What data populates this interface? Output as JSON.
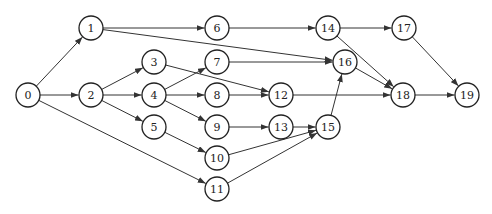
{
  "diagram": {
    "type": "directed-network",
    "node_radius": 12,
    "colors": {
      "stroke": "#222222",
      "fill": "#ffffff",
      "edge": "#333333"
    },
    "nodes": [
      {
        "id": "0",
        "label": "0",
        "x": 28,
        "y": 95
      },
      {
        "id": "1",
        "label": "1",
        "x": 91,
        "y": 28
      },
      {
        "id": "2",
        "label": "2",
        "x": 91,
        "y": 95
      },
      {
        "id": "3",
        "label": "3",
        "x": 154,
        "y": 62
      },
      {
        "id": "4",
        "label": "4",
        "x": 154,
        "y": 95
      },
      {
        "id": "5",
        "label": "5",
        "x": 154,
        "y": 127
      },
      {
        "id": "6",
        "label": "6",
        "x": 217,
        "y": 28
      },
      {
        "id": "7",
        "label": "7",
        "x": 217,
        "y": 62
      },
      {
        "id": "8",
        "label": "8",
        "x": 217,
        "y": 95
      },
      {
        "id": "9",
        "label": "9",
        "x": 217,
        "y": 127
      },
      {
        "id": "10",
        "label": "10",
        "x": 217,
        "y": 158
      },
      {
        "id": "11",
        "label": "11",
        "x": 217,
        "y": 189
      },
      {
        "id": "12",
        "label": "12",
        "x": 281,
        "y": 95
      },
      {
        "id": "13",
        "label": "13",
        "x": 281,
        "y": 127
      },
      {
        "id": "14",
        "label": "14",
        "x": 328,
        "y": 28
      },
      {
        "id": "15",
        "label": "15",
        "x": 328,
        "y": 127
      },
      {
        "id": "16",
        "label": "16",
        "x": 345,
        "y": 62
      },
      {
        "id": "17",
        "label": "17",
        "x": 404,
        "y": 28
      },
      {
        "id": "18",
        "label": "18",
        "x": 403,
        "y": 95
      },
      {
        "id": "19",
        "label": "19",
        "x": 467,
        "y": 95
      }
    ],
    "edges": [
      {
        "from": "0",
        "to": "1"
      },
      {
        "from": "0",
        "to": "2"
      },
      {
        "from": "0",
        "to": "11"
      },
      {
        "from": "1",
        "to": "6"
      },
      {
        "from": "1",
        "to": "16"
      },
      {
        "from": "2",
        "to": "3"
      },
      {
        "from": "2",
        "to": "4"
      },
      {
        "from": "2",
        "to": "5"
      },
      {
        "from": "3",
        "to": "12"
      },
      {
        "from": "4",
        "to": "7"
      },
      {
        "from": "4",
        "to": "8"
      },
      {
        "from": "4",
        "to": "9"
      },
      {
        "from": "5",
        "to": "10"
      },
      {
        "from": "6",
        "to": "14"
      },
      {
        "from": "7",
        "to": "16"
      },
      {
        "from": "8",
        "to": "12"
      },
      {
        "from": "9",
        "to": "13"
      },
      {
        "from": "10",
        "to": "15"
      },
      {
        "from": "11",
        "to": "15"
      },
      {
        "from": "13",
        "to": "15"
      },
      {
        "from": "12",
        "to": "18"
      },
      {
        "from": "14",
        "to": "17"
      },
      {
        "from": "14",
        "to": "18"
      },
      {
        "from": "15",
        "to": "16"
      },
      {
        "from": "16",
        "to": "18"
      },
      {
        "from": "17",
        "to": "19"
      },
      {
        "from": "18",
        "to": "19"
      }
    ]
  }
}
